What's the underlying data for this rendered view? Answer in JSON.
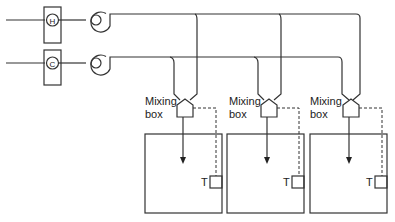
{
  "diagram": {
    "type": "dual-duct HVAC system schematic",
    "supply": {
      "hot": {
        "coil_label": "H",
        "name": "heating coil",
        "line_y": 20
      },
      "cold": {
        "coil_label": "C",
        "name": "cooling coil",
        "line_y": 63
      }
    },
    "zones": [
      {
        "mixing_label_line1": "Mixing",
        "mixing_label_line2": "box",
        "sensor_label": "T"
      },
      {
        "mixing_label_line1": "Mixing",
        "mixing_label_line2": "box",
        "sensor_label": "T"
      },
      {
        "mixing_label_line1": "Mixing",
        "mixing_label_line2": "box",
        "sensor_label": "T"
      }
    ],
    "colors": {
      "line": "#333333",
      "background": "#ffffff"
    }
  }
}
